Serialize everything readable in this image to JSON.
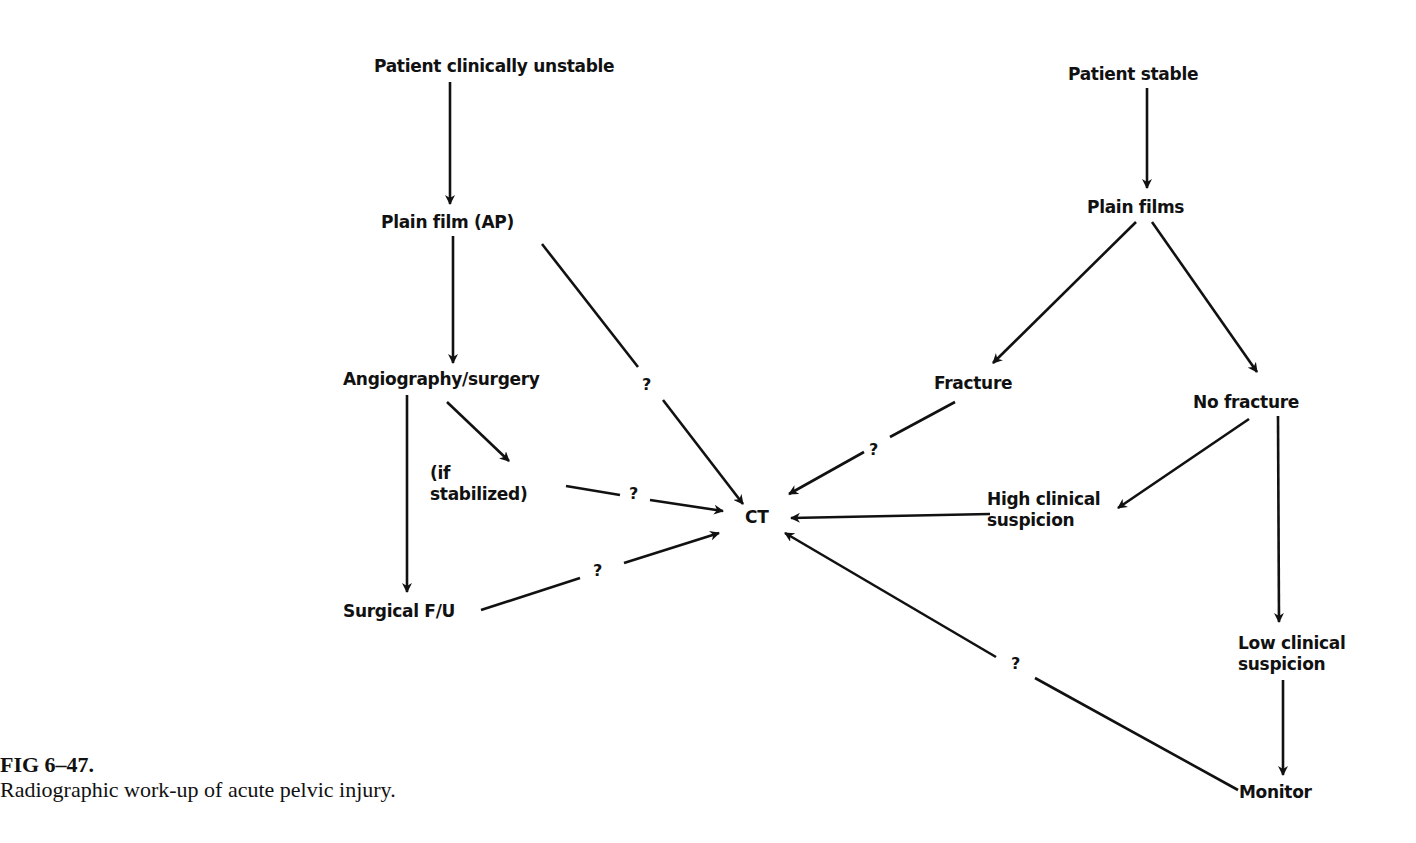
{
  "diagram": {
    "nodes": {
      "unstable": "Patient clinically unstable",
      "plain_film_ap": "Plain film (AP)",
      "angio": "Angiography/surgery",
      "if_stabilized": "(if\nstabilized)",
      "surgical_fu": "Surgical F/U",
      "ct": "CT",
      "stable": "Patient stable",
      "plain_films": "Plain films",
      "fracture": "Fracture",
      "no_fracture": "No fracture",
      "high_suspicion": "High clinical\nsuspicion",
      "low_suspicion": "Low clinical\nsuspicion",
      "monitor": "Monitor"
    },
    "edge_labels": {
      "q1": "?",
      "q2": "?",
      "q3": "?",
      "q4": "?",
      "q5": "?"
    },
    "edges": [
      {
        "from": "Patient clinically unstable",
        "to": "Plain film (AP)"
      },
      {
        "from": "Plain film (AP)",
        "to": "Angiography/surgery"
      },
      {
        "from": "Plain film (AP)",
        "to": "CT",
        "label": "?"
      },
      {
        "from": "Angiography/surgery",
        "to": "(if stabilized)"
      },
      {
        "from": "Angiography/surgery",
        "to": "Surgical F/U"
      },
      {
        "from": "(if stabilized)",
        "to": "CT",
        "label": "?"
      },
      {
        "from": "Surgical F/U",
        "to": "CT",
        "label": "?"
      },
      {
        "from": "Patient stable",
        "to": "Plain films"
      },
      {
        "from": "Plain films",
        "to": "Fracture"
      },
      {
        "from": "Plain films",
        "to": "No fracture"
      },
      {
        "from": "Fracture",
        "to": "CT",
        "label": "?"
      },
      {
        "from": "No fracture",
        "to": "High clinical suspicion"
      },
      {
        "from": "No fracture",
        "to": "Low clinical suspicion"
      },
      {
        "from": "High clinical suspicion",
        "to": "CT"
      },
      {
        "from": "Low clinical suspicion",
        "to": "Monitor"
      },
      {
        "from": "Monitor",
        "to": "CT",
        "label": "?"
      }
    ]
  },
  "caption": {
    "title": "FIG 6–47.",
    "text": "Radiographic work-up of acute pelvic injury."
  }
}
